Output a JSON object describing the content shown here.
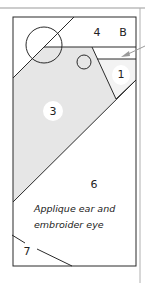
{
  "diagram": {
    "type": "quilt-block-piecing-template",
    "block_letter": "B",
    "pieces": [
      {
        "id": "1",
        "label": "1"
      },
      {
        "id": "3",
        "label": "3"
      },
      {
        "id": "4",
        "label": "4"
      },
      {
        "id": "6",
        "label": "6"
      },
      {
        "id": "7",
        "label": "7"
      }
    ],
    "note": {
      "line1": "Applique ear and",
      "line2": "embroider eye"
    },
    "colors": {
      "outline": "#2a2a2a",
      "shaded_piece": "#e6e6e6",
      "guide_line": "#9a9a9a",
      "label_circle": "#ffffff",
      "background": "#ffffff"
    }
  }
}
